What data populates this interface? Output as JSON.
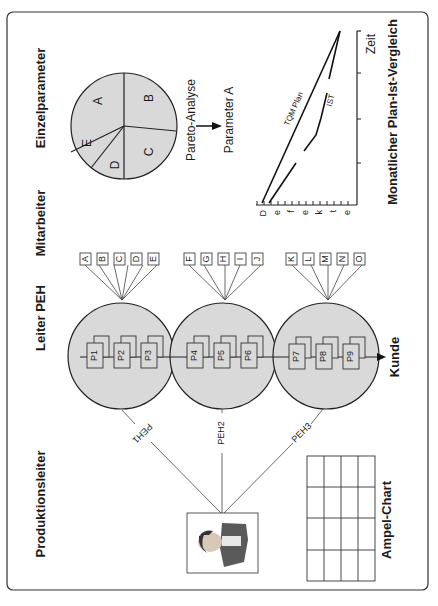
{
  "headings": {
    "einzelparameter": "Einzelparameter",
    "mitarbeiter": "Mitarbeiter",
    "leiter_peh": "Leiter PEH",
    "produktionsleiter": "Produktionsleiter"
  },
  "pie": {
    "slices": [
      "A",
      "B",
      "C",
      "D",
      "E"
    ],
    "fill": "#d9d9d9"
  },
  "pareto": {
    "label": "Pareto-Analyse",
    "result": "Parameter A"
  },
  "trend_chart": {
    "title": "Monatlicher Plan-Ist-Vergleich",
    "x_label": "Zeit",
    "y_label_letters": [
      "D",
      "e",
      "f",
      "e",
      "k",
      "t",
      "e"
    ],
    "series": [
      {
        "name": "TQM Plan"
      },
      {
        "name": "IST"
      }
    ]
  },
  "employees": {
    "group1": [
      "A",
      "B",
      "C",
      "D",
      "E"
    ],
    "group2": [
      "F",
      "G",
      "H",
      "I",
      "J"
    ],
    "group3": [
      "K",
      "L",
      "M",
      "N",
      "O"
    ]
  },
  "processes": {
    "circle1": [
      "P1",
      "P2",
      "P3"
    ],
    "circle2": [
      "P4",
      "P5",
      "P6"
    ],
    "circle3": [
      "P7",
      "P8",
      "P9"
    ],
    "customer": "Kunde",
    "circle_fill": "#d9d9d9"
  },
  "connections": {
    "peh1": "PEH1",
    "peh2": "PEH2",
    "peh3": "PEH3"
  },
  "ampel_chart": {
    "label": "Ampel-Chart",
    "rows": 4,
    "cols": 4
  }
}
